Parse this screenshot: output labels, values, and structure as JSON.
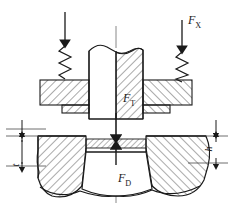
{
  "figure": {
    "kind": "engineering-cross-section",
    "background_color": "#ffffff",
    "line_color": "#1a1a1a",
    "hatch_color": "#2b2b2b"
  },
  "forces": {
    "blank_holder": {
      "symbol": "F",
      "subscript": "X",
      "full": "FX",
      "direction": "down",
      "applied_via": "compression-spring",
      "instances": 2
    },
    "punch": {
      "symbol": "F",
      "subscript": "T",
      "full": "FT",
      "direction": "down",
      "applied_via": "punch"
    },
    "die": {
      "symbol": "F",
      "subscript": "D",
      "full": "FD",
      "direction": "up",
      "applied_via": "die-cavity"
    }
  },
  "dimensions": {
    "left": {
      "symbol": "t",
      "orientation": "vertical",
      "side": "left",
      "meaning": "sheet/step thickness dimension"
    },
    "right": {
      "symbol": "h",
      "orientation": "vertical",
      "side": "right",
      "meaning": "draw depth dimension"
    }
  },
  "components": [
    {
      "name": "punch",
      "position": "center-top",
      "section": "broken-out-half-hatched"
    },
    {
      "name": "blank-holder-left",
      "position": "upper-left",
      "section": "hatched"
    },
    {
      "name": "blank-holder-right",
      "position": "upper-right",
      "section": "hatched"
    },
    {
      "name": "spring-left",
      "position": "upper-left",
      "type": "coil-compression"
    },
    {
      "name": "spring-right",
      "position": "upper-right",
      "type": "coil-compression"
    },
    {
      "name": "sheet-blank",
      "position": "center",
      "section": "thin-hatched"
    },
    {
      "name": "die-left",
      "position": "lower-left",
      "section": "hatched-broken"
    },
    {
      "name": "die-right",
      "position": "lower-right",
      "section": "hatched-broken"
    },
    {
      "name": "centerline",
      "position": "center",
      "type": "axis"
    }
  ],
  "icons": {
    "arrow_down": "arrow-down-icon",
    "spring": "coil-spring-icon",
    "centerline": "centerline-axis-icon"
  }
}
